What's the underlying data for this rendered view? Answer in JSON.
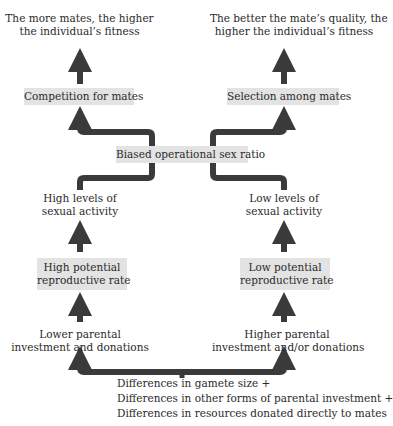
{
  "diagram": {
    "colors": {
      "arrow": "#3a3a3a",
      "box_fill": "#e3e3e3",
      "text": "#2a2a2a",
      "background": "#ffffff"
    },
    "top_left_outcome": {
      "line1": "The more mates, the higher",
      "line2": "the individual’s fitness"
    },
    "top_right_outcome": {
      "line1": "The better the mate’s quality, the",
      "line2": "higher the individual’s fitness"
    },
    "left_mechanism_box": "Competition for mates",
    "right_mechanism_box": "Selection among mates",
    "center_box": "Biased operational sex ratio",
    "left_activity": {
      "line1": "High levels of",
      "line2": "sexual activity"
    },
    "right_activity": {
      "line1": "Low levels of",
      "line2": "sexual activity"
    },
    "left_rate_box": {
      "line1": "High potential",
      "line2": "reproductive rate"
    },
    "right_rate_box": {
      "line1": "Low potential",
      "line2": "reproductive rate"
    },
    "left_investment": {
      "line1": "Lower parental",
      "line2": "investment and donations"
    },
    "right_investment": {
      "line1": "Higher parental",
      "line2": "investment and/or donations"
    },
    "root_causes": [
      "Differences in gamete size +",
      "Differences in other forms of parental investment +",
      "Differences in resources donated directly to mates"
    ]
  }
}
